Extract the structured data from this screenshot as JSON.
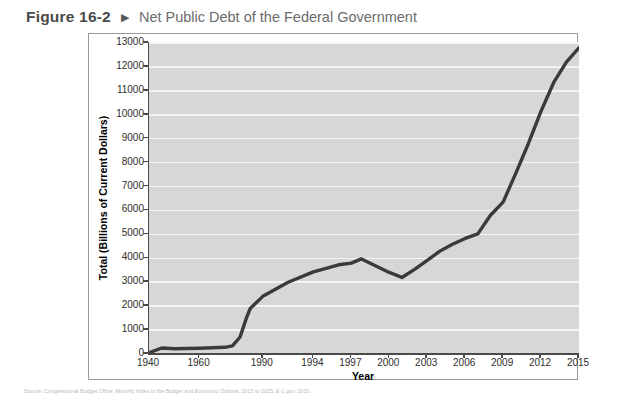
{
  "header": {
    "figure_number": "Figure 16-2",
    "arrow_icon": "triangle-right-icon",
    "title": "Net Public Debt of the Federal Government"
  },
  "source_note": "Source: Congressional Budget Office; Monthly Index to the Budget and Economic Outlook: 2015 to 2025; E-1 gov; 2015.",
  "chart_data": {
    "type": "line",
    "title": "Net Public Debt of the Federal Government",
    "xlabel": "Year",
    "ylabel": "Total (Billions of Current Dollars)",
    "ylim": [
      0,
      13000
    ],
    "ytick_step": 1000,
    "yticks": [
      0,
      1000,
      2000,
      3000,
      4000,
      5000,
      6000,
      7000,
      8000,
      9000,
      10000,
      11000,
      12000,
      13000
    ],
    "xticks": [
      "1940",
      "1960",
      "1990",
      "1994",
      "1997",
      "2000",
      "2003",
      "2006",
      "2009",
      "2012",
      "2015"
    ],
    "xtick_positions": [
      0,
      2,
      4.5,
      6.5,
      8,
      9.5,
      11,
      12.5,
      14,
      15.5,
      17
    ],
    "grid": true,
    "grid_color": "#f4f4f4",
    "plot_background": "#d7d7d7",
    "line_color": "#3a3a3a",
    "line_width": 3.4,
    "legend": null,
    "categories": [
      "1940",
      "1945",
      "1950",
      "1955",
      "1960",
      "1965",
      "1970",
      "1975",
      "1980",
      "1985",
      "1987",
      "1990",
      "1992",
      "1994",
      "1996",
      "1997",
      "1998",
      "2000",
      "2001",
      "2002",
      "2003",
      "2004",
      "2005",
      "2006",
      "2007",
      "2008",
      "2009",
      "2010",
      "2011",
      "2012",
      "2013",
      "2014",
      "2015"
    ],
    "x": [
      0,
      0.5,
      1,
      1.5,
      2,
      2.5,
      3,
      3.3,
      3.6,
      3.85,
      4.0,
      4.5,
      5.5,
      6.5,
      7.5,
      8,
      8.4,
      9.5,
      10,
      10.5,
      11,
      11.5,
      12,
      12.5,
      13,
      13.5,
      14,
      14.5,
      15,
      15.5,
      16,
      16.5,
      17
    ],
    "values": [
      50,
      250,
      220,
      230,
      240,
      260,
      280,
      340,
      710,
      1500,
      1900,
      2410,
      3000,
      3430,
      3730,
      3800,
      3975,
      3410,
      3200,
      3540,
      3910,
      4300,
      4590,
      4830,
      5020,
      5800,
      6350,
      7550,
      8800,
      10150,
      11350,
      12200,
      12800
    ],
    "annotations": []
  }
}
